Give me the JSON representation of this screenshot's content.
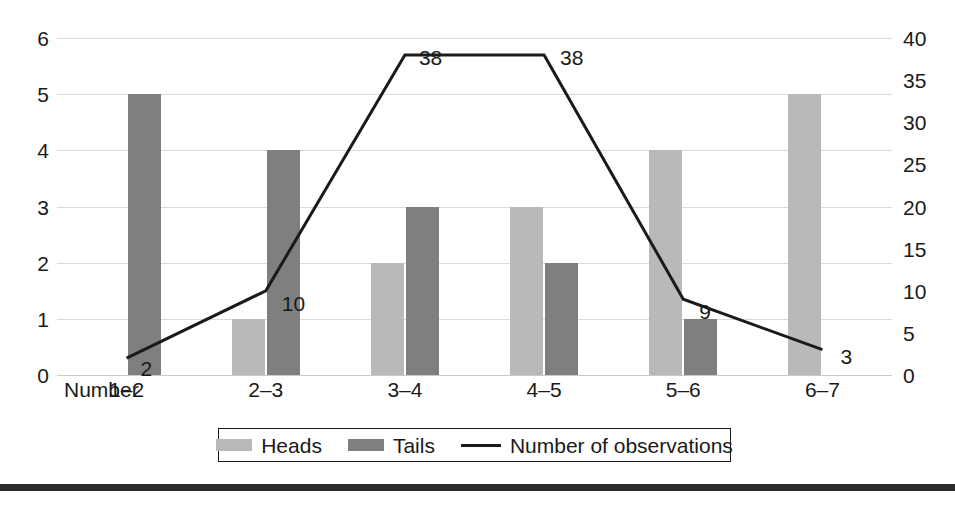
{
  "chart_data": {
    "type": "bar",
    "title": "",
    "subtitle": "",
    "xlabel": "Number",
    "ylabel": "",
    "y2label": "",
    "categories": [
      "1–2",
      "2–3",
      "3–4",
      "4–5",
      "5–6",
      "6–7"
    ],
    "series": [
      {
        "name": "Heads",
        "type": "bar",
        "axis": "left",
        "color": "#b9b9b9",
        "values": [
          0,
          1,
          2,
          3,
          4,
          5
        ]
      },
      {
        "name": "Tails",
        "type": "bar",
        "axis": "left",
        "color": "#7f7f7f",
        "values": [
          5,
          4,
          3,
          2,
          1,
          0
        ]
      },
      {
        "name": "Number of observations",
        "type": "line",
        "axis": "right",
        "color": "#1a1a1a",
        "values": [
          2,
          10,
          38,
          38,
          9,
          3
        ]
      }
    ],
    "data_labels": [
      "2",
      "10",
      "38",
      "38",
      "9",
      "3"
    ],
    "ylim": [
      0,
      6
    ],
    "y2lim": [
      0,
      40
    ],
    "yticks": [
      "6",
      "5",
      "4",
      "3",
      "2",
      "1",
      "0"
    ],
    "ytick_values": [
      6,
      5,
      4,
      3,
      2,
      1,
      0
    ],
    "y2ticks": [
      "40",
      "35",
      "30",
      "25",
      "20",
      "15",
      "10",
      "5",
      "0"
    ],
    "y2tick_values": [
      40,
      35,
      30,
      25,
      20,
      15,
      10,
      5,
      0
    ],
    "grid": true,
    "grid_axis": "y",
    "legend_position": "bottom",
    "legend": [
      {
        "label": "Heads",
        "marker": "swatch",
        "color": "#b9b9b9"
      },
      {
        "label": "Tails",
        "marker": "swatch",
        "color": "#7f7f7f"
      },
      {
        "label": "Number of observations",
        "marker": "line",
        "color": "#1a1a1a"
      }
    ]
  },
  "colors": {
    "heads": "#b9b9b9",
    "tails": "#7f7f7f",
    "line": "#1a1a1a",
    "grid": "#d9d9d9",
    "text": "#1a1a1a",
    "rule": "#2b2b2b",
    "background": "#ffffff"
  }
}
